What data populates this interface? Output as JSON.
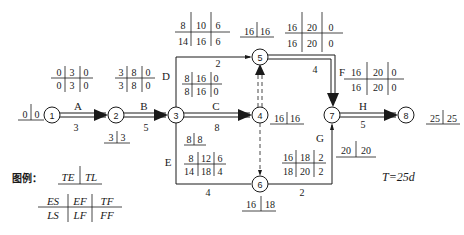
{
  "total_duration": "T=25d",
  "legend": {
    "label": "图例：",
    "node_cells": [
      "TE",
      "TL"
    ],
    "activity_cells_top": [
      "ES",
      "EF",
      "TF"
    ],
    "activity_cells_bottom": [
      "LS",
      "LF",
      "FF"
    ]
  },
  "nodes": [
    {
      "id": "1",
      "TE": "0",
      "TL": "0"
    },
    {
      "id": "2",
      "TE": "3",
      "TL": "3"
    },
    {
      "id": "3",
      "TE": "8",
      "TL": "8"
    },
    {
      "id": "4",
      "TE": "16",
      "TL": "16"
    },
    {
      "id": "5",
      "TE": "16",
      "TL": "16"
    },
    {
      "id": "6",
      "TE": "16",
      "TL": "18"
    },
    {
      "id": "7",
      "TE": "20",
      "TL": "20"
    },
    {
      "id": "8",
      "TE": "25",
      "TL": "25"
    }
  ],
  "activities": [
    {
      "name": "A",
      "from": "1",
      "to": "2",
      "duration": "3",
      "ES": "0",
      "EF": "3",
      "TF": "0",
      "LS": "0",
      "LF": "3",
      "FF": "0"
    },
    {
      "name": "B",
      "from": "2",
      "to": "3",
      "duration": "5",
      "ES": "3",
      "EF": "8",
      "TF": "0",
      "LS": "3",
      "LF": "8",
      "FF": "0"
    },
    {
      "name": "C",
      "from": "3",
      "to": "4",
      "duration": "8",
      "ES": "8",
      "EF": "16",
      "TF": "0",
      "LS": "8",
      "LF": "16",
      "FF": "0"
    },
    {
      "name": "D",
      "from": "3",
      "to": "5",
      "duration": "2",
      "ES": "8",
      "EF": "10",
      "TF": "6",
      "LS": "14",
      "LF": "16",
      "FF": "6"
    },
    {
      "name": "E",
      "from": "3",
      "to": "6",
      "duration": "4",
      "ES": "8",
      "EF": "12",
      "TF": "6",
      "LS": "14",
      "LF": "18",
      "FF": "4"
    },
    {
      "name": "F",
      "from": "5",
      "to": "7",
      "duration": "4",
      "ES": "16",
      "EF": "20",
      "TF": "0",
      "LS": "16",
      "LF": "20",
      "FF": "0"
    },
    {
      "name": "G",
      "from": "6",
      "to": "7",
      "duration": "2",
      "ES": "16",
      "EF": "18",
      "TF": "2",
      "LS": "18",
      "LF": "20",
      "FF": "2"
    },
    {
      "name": "H",
      "from": "7",
      "to": "8",
      "duration": "5",
      "ES": "20",
      "EF": "25",
      "TF": "0",
      "LS": "20",
      "LF": "25",
      "FF": "0"
    }
  ],
  "dummies": [
    {
      "from": "4",
      "to": "5"
    },
    {
      "from": "4",
      "to": "6"
    }
  ],
  "colors": {
    "ink": "#1a1a1a",
    "background": "#ffffff"
  }
}
